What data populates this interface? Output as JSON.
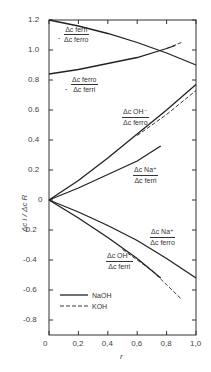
{
  "chart_data": {
    "type": "line",
    "title": "",
    "xlabel": "r",
    "ylabel": "Δc_i / Δc_R",
    "xlim": [
      0,
      1.0
    ],
    "ylim": [
      -0.9,
      1.2
    ],
    "x_ticks": [
      "0",
      "0,2",
      "0,4",
      "0,6",
      "0,8",
      "1,0"
    ],
    "y_ticks": [
      "1.2",
      "1.0",
      "0.8",
      "0.6",
      "0.4",
      "0.2",
      "0",
      "-0.2",
      "-0.4",
      "-0.6",
      "-0.8"
    ],
    "grid": false,
    "legend": [
      {
        "label": "NaOH",
        "style": "solid"
      },
      {
        "label": "KOH",
        "style": "dashed"
      }
    ],
    "legend_position": "lower left",
    "series": [
      {
        "name": "-Δc_ferri/Δc_ferro (NaOH)",
        "style": "solid",
        "x": [
          0,
          0.2,
          0.4,
          0.6,
          0.8,
          1.0
        ],
        "y": [
          1.2,
          1.16,
          1.11,
          1.05,
          0.98,
          0.9
        ]
      },
      {
        "name": "-Δc_ferro/Δc_ferri (NaOH)",
        "style": "solid",
        "x": [
          0,
          0.2,
          0.4,
          0.6,
          0.8,
          0.86
        ],
        "y": [
          0.84,
          0.87,
          0.91,
          0.95,
          1.01,
          1.03
        ]
      },
      {
        "name": "-Δc_ferro/Δc_ferri (KOH)",
        "style": "dashed",
        "x": [
          0.8,
          0.9
        ],
        "y": [
          1.01,
          1.05
        ]
      },
      {
        "name": "Δc_OH-/Δc_ferro (NaOH)",
        "style": "solid",
        "x": [
          0,
          0.2,
          0.4,
          0.6,
          0.8,
          1.0
        ],
        "y": [
          0,
          0.13,
          0.28,
          0.44,
          0.6,
          0.77
        ]
      },
      {
        "name": "Δc_OH-/Δc_ferro (KOH)",
        "style": "dashed",
        "x": [
          0.6,
          0.8,
          1.0
        ],
        "y": [
          0.43,
          0.57,
          0.73
        ]
      },
      {
        "name": "Δc_Na+/Δc_ferri (NaOH)",
        "style": "solid",
        "x": [
          0,
          0.2,
          0.4,
          0.6,
          0.76
        ],
        "y": [
          0,
          0.08,
          0.17,
          0.26,
          0.36
        ]
      },
      {
        "name": "Δc_Na+/Δc_ferro (NaOH)",
        "style": "solid",
        "x": [
          0,
          0.2,
          0.4,
          0.6,
          0.8,
          1.0
        ],
        "y": [
          0,
          -0.08,
          -0.17,
          -0.27,
          -0.39,
          -0.52
        ]
      },
      {
        "name": "Δc_OH-/Δc_ferri (NaOH)",
        "style": "solid",
        "x": [
          0,
          0.2,
          0.4,
          0.6,
          0.76
        ],
        "y": [
          0,
          -0.12,
          -0.25,
          -0.39,
          -0.52
        ]
      },
      {
        "name": "Δc_OH-/Δc_ferri (KOH)",
        "style": "dashed",
        "x": [
          0.5,
          0.7,
          0.9
        ],
        "y": [
          -0.33,
          -0.47,
          -0.66
        ]
      }
    ],
    "annotations": [
      {
        "num": "Δc_ferri",
        "den": "Δc_ferro",
        "prefix": "-"
      },
      {
        "num": "Δc_ferro",
        "den": "Δc_ferri",
        "prefix": "-"
      },
      {
        "num": "Δc_OH⁻",
        "den": "Δc_ferro",
        "prefix": ""
      },
      {
        "num": "Δc_Na⁺",
        "den": "Δc_ferri",
        "prefix": ""
      },
      {
        "num": "Δc_Na⁺",
        "den": "Δc_ferro",
        "prefix": ""
      },
      {
        "num": "Δc_OH⁻",
        "den": "Δc_ferri",
        "prefix": ""
      }
    ]
  },
  "labels": {
    "a1n": "Δc ferri",
    "a1d": "Δc ferro",
    "a2n": "Δc ferro",
    "a2d": "Δc ferri",
    "a3n": "Δc OH⁻",
    "a3d": "Δc ferro",
    "a4n": "Δc Na⁺",
    "a4d": "Δc ferri",
    "a5n": "Δc Na⁺",
    "a5d": "Δc ferro",
    "a6n": "Δc OH⁻",
    "a6d": "Δc ferri",
    "minus": "-",
    "legend_naoh": "NaOH",
    "legend_koh": "KOH",
    "xlabel": "r",
    "ylabel": "Δc i / Δc R"
  }
}
